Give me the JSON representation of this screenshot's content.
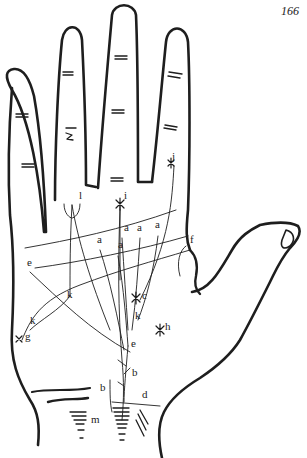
{
  "page": {
    "number": "166"
  },
  "figure": {
    "colors": {
      "ink": "#1e1e1e",
      "paper": "#ffffff"
    },
    "labels": [
      {
        "id": "j",
        "text": "j",
        "x": 172,
        "y": 160
      },
      {
        "id": "i",
        "text": "i",
        "x": 124,
        "y": 199
      },
      {
        "id": "l",
        "text": "l",
        "x": 79,
        "y": 199
      },
      {
        "id": "a1",
        "text": "a",
        "x": 124,
        "y": 231
      },
      {
        "id": "a2",
        "text": "a",
        "x": 137,
        "y": 231
      },
      {
        "id": "a3",
        "text": "a",
        "x": 155,
        "y": 228
      },
      {
        "id": "a4",
        "text": "a",
        "x": 97,
        "y": 243
      },
      {
        "id": "a5",
        "text": "a",
        "x": 118,
        "y": 248
      },
      {
        "id": "f",
        "text": "f",
        "x": 190,
        "y": 243
      },
      {
        "id": "e1",
        "text": "e",
        "x": 27,
        "y": 266
      },
      {
        "id": "k1",
        "text": "k",
        "x": 67,
        "y": 298
      },
      {
        "id": "c",
        "text": "c",
        "x": 142,
        "y": 299
      },
      {
        "id": "k2",
        "text": "k",
        "x": 135,
        "y": 319
      },
      {
        "id": "h",
        "text": "h",
        "x": 165,
        "y": 330
      },
      {
        "id": "k3",
        "text": "k",
        "x": 30,
        "y": 324
      },
      {
        "id": "g",
        "text": "g",
        "x": 25,
        "y": 340
      },
      {
        "id": "e2",
        "text": "e",
        "x": 131,
        "y": 347
      },
      {
        "id": "b1",
        "text": "b",
        "x": 132,
        "y": 376
      },
      {
        "id": "b2",
        "text": "b",
        "x": 100,
        "y": 391
      },
      {
        "id": "d",
        "text": "d",
        "x": 142,
        "y": 398
      },
      {
        "id": "m",
        "text": "m",
        "x": 91,
        "y": 423
      }
    ]
  }
}
